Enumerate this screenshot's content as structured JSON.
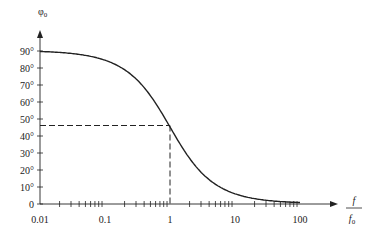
{
  "chart_data": {
    "type": "line",
    "title": "",
    "xlabel": "f / f0",
    "ylabel": "φ0",
    "x_scale": "log",
    "xlim": [
      0.01,
      100
    ],
    "ylim": [
      0,
      90
    ],
    "grid": false,
    "x_ticks": [
      "0.01",
      "0.1",
      "1",
      "10",
      "100"
    ],
    "y_ticks": [
      "0",
      "10°",
      "20°",
      "30°",
      "40°",
      "50°",
      "60°",
      "70°",
      "80°",
      "90°"
    ],
    "series": [
      {
        "name": "phase",
        "x": [
          0.01,
          0.02,
          0.05,
          0.1,
          0.2,
          0.5,
          1,
          2,
          5,
          10,
          20,
          50,
          100
        ],
        "y": [
          89.4,
          88.9,
          87.1,
          84.3,
          78.7,
          63.4,
          45.0,
          26.6,
          11.3,
          5.7,
          2.9,
          1.1,
          0.6
        ]
      }
    ],
    "annotations": [
      {
        "type": "dashed-line",
        "description": "horizontal dashed line at 45° from y-axis to curve",
        "y": 45
      },
      {
        "type": "dashed-line",
        "description": "vertical dashed line at f/f0 = 1 from curve to x-axis",
        "x": 1
      }
    ]
  },
  "axes": {
    "y_label_main": "φ",
    "y_label_sub": "0",
    "x_label_num": "f",
    "x_label_den": "f",
    "x_label_den_sub": "0"
  }
}
